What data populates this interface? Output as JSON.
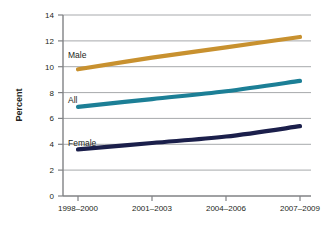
{
  "chart_data": {
    "type": "line",
    "title": "",
    "subtitle": "",
    "xlabel": "",
    "ylabel": "Percent",
    "categories": [
      "1998–2000",
      "2001–2003",
      "2004–2006",
      "2007–2009"
    ],
    "ylim": [
      0,
      14
    ],
    "yticks": [
      "0",
      "2",
      "4",
      "6",
      "8",
      "10",
      "12",
      "14"
    ],
    "ytick_values": [
      0,
      2,
      4,
      6,
      8,
      10,
      12,
      14
    ],
    "grid": "horizontal",
    "legend_position": "inline-labels",
    "series": [
      {
        "name": "Male",
        "color": "#c8912f",
        "values": [
          9.8,
          10.7,
          11.5,
          12.3
        ],
        "label": "Male"
      },
      {
        "name": "All",
        "color": "#1c7f96",
        "values": [
          6.9,
          7.5,
          8.1,
          8.9
        ],
        "label": "All"
      },
      {
        "name": "Female",
        "color": "#1b1f4b",
        "values": [
          3.6,
          4.1,
          4.6,
          5.4
        ],
        "label": "Female"
      }
    ],
    "axis_color": "#808285",
    "grid_color": "#a7a9ac",
    "background": "#ffffff"
  }
}
